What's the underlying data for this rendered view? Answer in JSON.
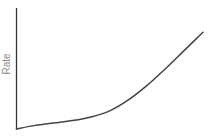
{
  "chart_data": {
    "type": "line",
    "title": "",
    "xlabel": "",
    "ylabel": "Rate",
    "grid": false,
    "legend": null,
    "x_ticks": [],
    "y_ticks": [],
    "series": [
      {
        "name": "Rate",
        "color": "#444444",
        "x": [
          0,
          0.1,
          0.2,
          0.3,
          0.4,
          0.5,
          0.6,
          0.7,
          0.8,
          0.9,
          1.0
        ],
        "values": [
          0,
          0.03,
          0.05,
          0.07,
          0.1,
          0.15,
          0.24,
          0.36,
          0.5,
          0.65,
          0.8
        ]
      }
    ],
    "xlim": [
      0,
      1
    ],
    "ylim": [
      0,
      1
    ]
  },
  "axes": {
    "color": "#333333"
  }
}
